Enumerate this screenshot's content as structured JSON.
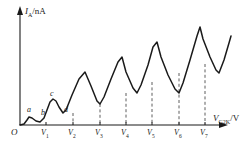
{
  "figure": {
    "kind": "line-plot",
    "stroke_color": "#1a1a1a",
    "dash_color": "#4d4d4d",
    "background": "#ffffff"
  },
  "axes": {
    "y_axis": {
      "label_symbol": "I",
      "label_subscript": "A",
      "label_unit": "/nA",
      "label_full": "IA/nA",
      "arrow": "up-arrow-icon",
      "x_px": 20,
      "top_px": 8,
      "bottom_px": 125
    },
    "x_axis": {
      "label_symbol": "V",
      "label_subscript": "G2K",
      "label_unit": "/V",
      "label_full": "VG2K/V",
      "arrow": "right-arrow-icon",
      "y_px": 125,
      "left_px": 20,
      "right_px": 228
    },
    "origin_label": "O"
  },
  "ticks": [
    {
      "label_symbol": "V",
      "label_sub": "1",
      "x_px": 46
    },
    {
      "label_symbol": "V",
      "label_sub": "2",
      "x_px": 73
    },
    {
      "label_symbol": "V",
      "label_sub": "3",
      "x_px": 100
    },
    {
      "label_symbol": "V",
      "label_sub": "4",
      "x_px": 126
    },
    {
      "label_symbol": "V",
      "label_sub": "5",
      "x_px": 152
    },
    {
      "label_symbol": "V",
      "label_sub": "6",
      "x_px": 179
    },
    {
      "label_symbol": "V",
      "label_sub": "7",
      "x_px": 205
    }
  ],
  "point_labels": [
    {
      "text": "a",
      "x_px": 27,
      "y_px": 106
    },
    {
      "text": "b",
      "x_px": 41,
      "y_px": 109
    },
    {
      "text": "c",
      "x_px": 50,
      "y_px": 90
    },
    {
      "text": "d",
      "x_px": 64,
      "y_px": 106
    }
  ],
  "dashed_drop_lines": [
    {
      "x_px": 73,
      "y_top_px": 113,
      "y_bottom_px": 125
    },
    {
      "x_px": 100,
      "y_top_px": 104,
      "y_bottom_px": 125
    },
    {
      "x_px": 126,
      "y_top_px": 93,
      "y_bottom_px": 125
    },
    {
      "x_px": 152,
      "y_top_px": 82,
      "y_bottom_px": 125
    },
    {
      "x_px": 179,
      "y_top_px": 73,
      "y_bottom_px": 125
    },
    {
      "x_px": 205,
      "y_top_px": 64,
      "y_bottom_px": 125
    }
  ],
  "chart_data": {
    "type": "line",
    "title": "",
    "xlabel": "VG2K/V",
    "ylabel": "IA/nA",
    "grid": false,
    "legend": false,
    "xticklabels": [
      "O",
      "V1",
      "V2",
      "V3",
      "V4",
      "V5",
      "V6",
      "V7"
    ],
    "yticklabels": [],
    "annotations": [
      "a",
      "b",
      "c",
      "d"
    ],
    "curve_points_px": [
      [
        20,
        125
      ],
      [
        24,
        124
      ],
      [
        27,
        120
      ],
      [
        29,
        117
      ],
      [
        32,
        118
      ],
      [
        36,
        121
      ],
      [
        40,
        122
      ],
      [
        44,
        118
      ],
      [
        47,
        110
      ],
      [
        50,
        102
      ],
      [
        53,
        99
      ],
      [
        56,
        101
      ],
      [
        59,
        107
      ],
      [
        63,
        113
      ],
      [
        66,
        110
      ],
      [
        72,
        95
      ],
      [
        79,
        79
      ],
      [
        85,
        72
      ],
      [
        91,
        86
      ],
      [
        97,
        101
      ],
      [
        100,
        104
      ],
      [
        104,
        97
      ],
      [
        111,
        79
      ],
      [
        118,
        62
      ],
      [
        122,
        57
      ],
      [
        126,
        72
      ],
      [
        133,
        88
      ],
      [
        137,
        93
      ],
      [
        141,
        85
      ],
      [
        148,
        65
      ],
      [
        153,
        47
      ],
      [
        157,
        42
      ],
      [
        161,
        57
      ],
      [
        168,
        75
      ],
      [
        175,
        89
      ],
      [
        179,
        93
      ],
      [
        183,
        83
      ],
      [
        190,
        60
      ],
      [
        197,
        36
      ],
      [
        200,
        27
      ],
      [
        203,
        39
      ],
      [
        210,
        57
      ],
      [
        216,
        70
      ],
      [
        219,
        73
      ],
      [
        224,
        60
      ],
      [
        229,
        43
      ],
      [
        231,
        36
      ]
    ]
  }
}
